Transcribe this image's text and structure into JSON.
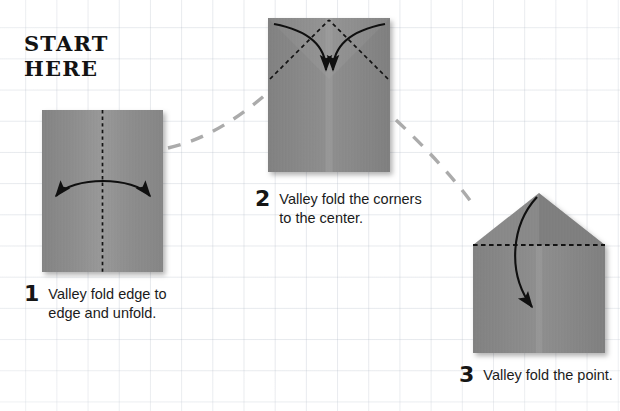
{
  "poster": {
    "title": "Paper airplane folding instructions",
    "start_label": "START\nHERE"
  },
  "palette": {
    "paper_light": "#9a9a9a",
    "paper_mid": "#8b8b8b",
    "paper_dark": "#7a7a7a",
    "paper_edge": "#6f6f6f",
    "fold_line": "#151515",
    "arrow": "#101010",
    "connector": "#a8a8a8",
    "grid": "#afb7c4",
    "text": "#1b1b1b",
    "background": "#ffffff"
  },
  "steps": [
    {
      "number": "1",
      "caption": "Valley fold edge to\nedge and unfold.",
      "figure_name": "flat-rectangle-with-center-crease",
      "fold_type": "valley",
      "fold_line_style": "dashed-vertical-center",
      "arrow_type": "double-headed-curve",
      "paper": {
        "x": 42,
        "y": 110,
        "width": 121,
        "height": 162
      }
    },
    {
      "number": "2",
      "caption": "Valley fold the corners\nto the center.",
      "figure_name": "rectangle-with-diagonal-corner-folds",
      "fold_type": "valley",
      "fold_line_style": "dashed-diagonals-to-apex",
      "arrow_type": "two-converging-curves",
      "paper": {
        "x": 268,
        "y": 18,
        "width": 122,
        "height": 154
      }
    },
    {
      "number": "3",
      "caption": "Valley fold the point.",
      "figure_name": "house-shape-with-horizontal-crease",
      "fold_type": "valley",
      "fold_line_style": "dashed-horizontal",
      "arrow_type": "single-curve-downward",
      "paper": {
        "x": 473,
        "y": 193,
        "width": 132,
        "height": 160
      }
    }
  ],
  "connectors": [
    {
      "name": "connector-step1-to-step2",
      "from_step": "1",
      "to_step": "2",
      "style": "dashed",
      "direction": "up-right"
    },
    {
      "name": "connector-step2-to-step3",
      "from_step": "2",
      "to_step": "3",
      "style": "dashed",
      "direction": "down-right"
    }
  ]
}
